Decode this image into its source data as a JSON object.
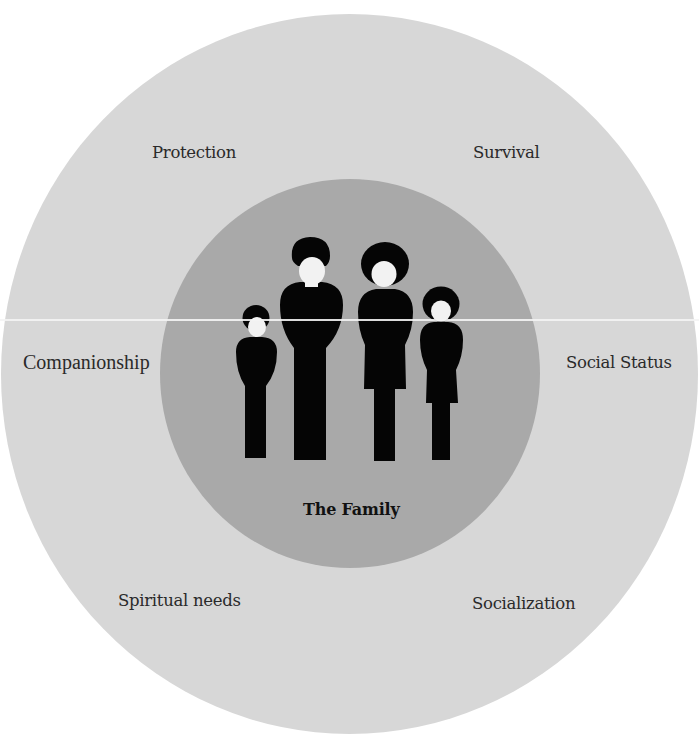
{
  "diagram": {
    "center": {
      "label": "The Family",
      "icon": "family-of-four-icon"
    },
    "functions": [
      {
        "id": "protection",
        "label": "Protection",
        "position": "top-left"
      },
      {
        "id": "survival",
        "label": "Survival",
        "position": "top-right"
      },
      {
        "id": "companionship",
        "label": "Companionship",
        "position": "left"
      },
      {
        "id": "social-status",
        "label": "Social Status",
        "position": "right"
      },
      {
        "id": "spiritual-needs",
        "label": "Spiritual needs",
        "position": "bottom-left"
      },
      {
        "id": "socialization",
        "label": "Socialization",
        "position": "bottom-right"
      }
    ],
    "figures": [
      "boy",
      "man",
      "woman",
      "girl"
    ],
    "colors": {
      "outer_ring": "#d7d7d7",
      "inner_circle": "#a9a9a9",
      "figures": "#050505",
      "faces": "#f2f2f2",
      "background": "#ffffff"
    }
  }
}
